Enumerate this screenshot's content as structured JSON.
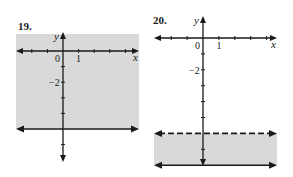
{
  "chart_data": [
    {
      "type": "line",
      "label": "19.",
      "description": "Graph of the inequality y ≥ -5",
      "xlabel": "x",
      "ylabel": "y",
      "tick_labels": {
        "origin": "0",
        "x_one": "1",
        "y_minus_two": "−2"
      },
      "xlim": [
        -3,
        5
      ],
      "ylim": [
        -7,
        1
      ],
      "x_ticks": [
        -2,
        -1,
        1,
        2,
        3,
        4
      ],
      "y_ticks": [
        -1,
        -2,
        -3,
        -4,
        -6
      ],
      "boundaries": [
        {
          "y": -5,
          "style": "solid"
        }
      ],
      "shaded_region": {
        "from": -5,
        "to": 1.1,
        "color": "#d9d9d9"
      },
      "grid": false
    },
    {
      "type": "line",
      "label": "20.",
      "description": "Graph of the inequality -8 ≤ y < -6",
      "xlabel": "x",
      "ylabel": "y",
      "tick_labels": {
        "origin": "0",
        "x_one": "1",
        "y_minus_two": "−2"
      },
      "xlim": [
        -3,
        5
      ],
      "ylim": [
        -8,
        1
      ],
      "x_ticks": [
        -2,
        -1,
        1,
        2,
        3,
        4
      ],
      "y_ticks": [
        -1,
        -2,
        -3,
        -4,
        -5,
        -7
      ],
      "boundaries": [
        {
          "y": -6,
          "style": "dashed"
        },
        {
          "y": -8,
          "style": "solid"
        }
      ],
      "shaded_region": {
        "from": -8,
        "to": -6,
        "color": "#d9d9d9"
      },
      "grid": false
    }
  ]
}
